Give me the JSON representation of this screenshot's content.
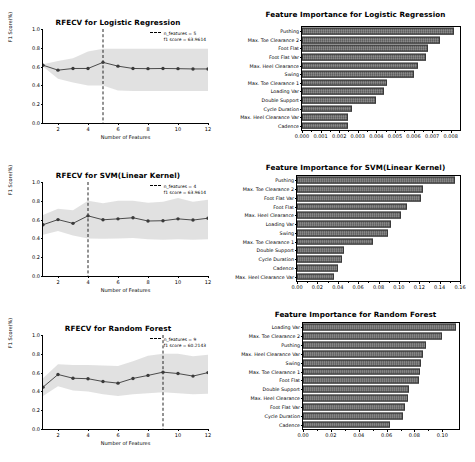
{
  "chart_data": [
    {
      "type": "line",
      "panel": "rfecv-logistic-regression",
      "title": "RFECV for Logistic Regression",
      "xlabel": "Number of Features",
      "ylabel": "F1 Score(%)",
      "xlim": [
        1,
        12
      ],
      "ylim": [
        0.0,
        1.0
      ],
      "xticks": [
        2,
        4,
        6,
        8,
        10,
        12
      ],
      "yticks": [
        "0.0",
        "0.2",
        "0.4",
        "0.6",
        "0.8",
        "1.0"
      ],
      "grid": false,
      "legend_position": "upper right",
      "legend": [
        "n_features = 5",
        "f1 score = 63.9614"
      ],
      "vline_x": 5,
      "x": [
        1,
        2,
        3,
        4,
        5,
        6,
        7,
        8,
        9,
        10,
        11,
        12
      ],
      "mean": [
        0.615,
        0.562,
        0.58,
        0.58,
        0.645,
        0.605,
        0.58,
        0.578,
        0.58,
        0.578,
        0.575,
        0.575
      ],
      "band_upper": [
        0.625,
        0.66,
        0.69,
        0.76,
        0.79,
        0.79,
        0.79,
        0.79,
        0.79,
        0.79,
        0.79,
        0.79
      ],
      "band_lower": [
        0.6,
        0.47,
        0.43,
        0.4,
        0.4,
        0.345,
        0.34,
        0.34,
        0.34,
        0.34,
        0.34,
        0.34
      ]
    },
    {
      "type": "bar",
      "panel": "feature-importance-logistic-regression",
      "orientation": "horizontal",
      "title": "Feature Importance for Logistic Regression",
      "xlabel": "",
      "ylabel": "",
      "xlim": [
        0.0,
        0.0085
      ],
      "xticks": [
        "0.000",
        "0.001",
        "0.002",
        "0.003",
        "0.004",
        "0.005",
        "0.006",
        "0.007",
        "0.008"
      ],
      "grid": false,
      "categories": [
        "Pushing",
        "Max. Toe Clearance 2",
        "Foot Flat",
        "Foot Flat Var",
        "Max. Heel Clearance",
        "Swing",
        "Max. Toe Clearance 1",
        "Loading Var",
        "Double Support",
        "Cycle Duration",
        "Max. Heel Clearance Var",
        "Cadence"
      ],
      "values": [
        0.0082,
        0.0074,
        0.0068,
        0.00665,
        0.00625,
        0.006,
        0.00455,
        0.0044,
        0.004,
        0.0027,
        0.0025,
        0.00245
      ]
    },
    {
      "type": "line",
      "panel": "rfecv-svm-linear-kernel",
      "title": "RFECV for SVM(Linear Kernel)",
      "xlabel": "Number of Features",
      "ylabel": "F1 Score(%)",
      "xlim": [
        1,
        12
      ],
      "ylim": [
        0.0,
        1.0
      ],
      "xticks": [
        2,
        4,
        6,
        8,
        10,
        12
      ],
      "yticks": [
        "0.0",
        "0.2",
        "0.4",
        "0.6",
        "0.8",
        "1.0"
      ],
      "grid": false,
      "legend_position": "upper right",
      "legend": [
        "n_features = 4",
        "f1 score = 63.9614"
      ],
      "vline_x": 4,
      "x": [
        1,
        2,
        3,
        4,
        5,
        6,
        7,
        8,
        9,
        10,
        11,
        12
      ],
      "mean": [
        0.545,
        0.6,
        0.56,
        0.64,
        0.598,
        0.608,
        0.62,
        0.585,
        0.588,
        0.608,
        0.595,
        0.615
      ],
      "band_upper": [
        0.65,
        0.715,
        0.7,
        0.8,
        0.775,
        0.8,
        0.8,
        0.78,
        0.79,
        0.83,
        0.79,
        0.81
      ],
      "band_lower": [
        0.44,
        0.48,
        0.43,
        0.4,
        0.395,
        0.4,
        0.405,
        0.39,
        0.385,
        0.39,
        0.385,
        0.39
      ]
    },
    {
      "type": "bar",
      "panel": "feature-importance-svm-linear-kernel",
      "orientation": "horizontal",
      "title": "Feature Importance for SVM(Linear Kernel)",
      "xlabel": "",
      "ylabel": "",
      "xlim": [
        0.0,
        0.16
      ],
      "xticks": [
        "0.00",
        "0.02",
        "0.04",
        "0.06",
        "0.08",
        "0.10",
        "0.12",
        "0.14",
        "0.16"
      ],
      "grid": false,
      "categories": [
        "Pushing",
        "Max. Toe Clearance 2",
        "Foot Flat Var",
        "Foot Flat",
        "Max. Heel Clearance",
        "Loading Var",
        "Swing",
        "Max. Toe Clearance 1",
        "Double Support",
        "Cycle Duration",
        "Cadence",
        "Max. Heel Clearance Var"
      ],
      "values": [
        0.1555,
        0.1235,
        0.1215,
        0.108,
        0.1025,
        0.0925,
        0.0895,
        0.0745,
        0.0465,
        0.0445,
        0.0405,
        0.0365
      ]
    },
    {
      "type": "line",
      "panel": "rfecv-random-forest",
      "title": "RFECV for Random Forest",
      "xlabel": "Number of Features",
      "ylabel": "F1 Score(%)",
      "xlim": [
        1,
        12
      ],
      "ylim": [
        0.0,
        1.0
      ],
      "xticks": [
        2,
        4,
        6,
        8,
        10,
        12
      ],
      "yticks": [
        "0.0",
        "0.2",
        "0.4",
        "0.6",
        "0.8",
        "1.0"
      ],
      "grid": false,
      "legend_position": "upper right",
      "legend": [
        "n_features = 9",
        "f1 score = 60.2143"
      ],
      "vline_x": 9,
      "x": [
        1,
        2,
        3,
        4,
        5,
        6,
        7,
        8,
        9,
        10,
        11,
        12
      ],
      "mean": [
        0.445,
        0.58,
        0.54,
        0.535,
        0.505,
        0.488,
        0.538,
        0.57,
        0.605,
        0.59,
        0.563,
        0.6
      ],
      "band_upper": [
        0.54,
        0.69,
        0.68,
        0.68,
        0.675,
        0.67,
        0.72,
        0.78,
        0.8,
        0.8,
        0.775,
        0.79
      ],
      "band_lower": [
        0.35,
        0.455,
        0.41,
        0.4,
        0.37,
        0.35,
        0.37,
        0.38,
        0.39,
        0.38,
        0.37,
        0.375
      ]
    },
    {
      "type": "bar",
      "panel": "feature-importance-random-forest",
      "orientation": "horizontal",
      "title": "Feature Importance for Random Forest",
      "xlabel": "",
      "ylabel": "",
      "xlim": [
        0.0,
        0.112
      ],
      "xticks": [
        "0.00",
        "0.02",
        "0.04",
        "0.06",
        "0.08",
        "0.10"
      ],
      "grid": false,
      "categories": [
        "Loading Var",
        "Max. Toe Clearance 2",
        "Pushing",
        "Max. Heel Clearance Var",
        "Swing",
        "Max. Toe Clearance 1",
        "Foot Flat",
        "Double Support",
        "Max. Heel Clearance",
        "Foot Flat Var",
        "Cycle Duration",
        "Cadence"
      ],
      "values": [
        0.11,
        0.0995,
        0.0885,
        0.0865,
        0.0845,
        0.084,
        0.0835,
        0.076,
        0.0755,
        0.0735,
        0.072,
        0.0625
      ]
    }
  ]
}
